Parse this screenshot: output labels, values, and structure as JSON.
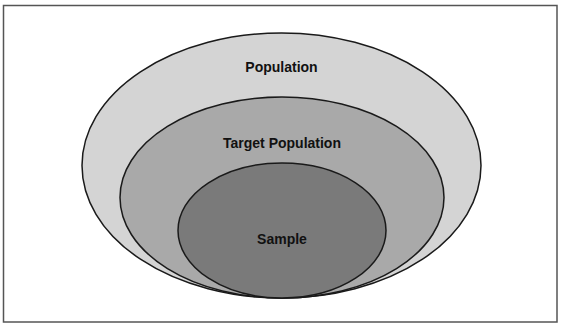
{
  "diagram": {
    "type": "nested-ellipses",
    "frame": {
      "stroke": "#555555"
    },
    "layers": [
      {
        "id": "population",
        "label": "Population",
        "fill": "#d4d4d4",
        "stroke": "#1a1a1a",
        "cx": 281.5,
        "cy": 165.5,
        "rx": 199.5,
        "ry": 132.5,
        "label_y": 72
      },
      {
        "id": "target-population",
        "label": "Target Population",
        "fill": "#a9a9a9",
        "stroke": "#1a1a1a",
        "cx": 282,
        "cy": 197.5,
        "rx": 162,
        "ry": 100.5,
        "label_y": 148
      },
      {
        "id": "sample",
        "label": "Sample",
        "fill": "#7a7a7a",
        "stroke": "#1a1a1a",
        "cx": 282,
        "cy": 230.5,
        "rx": 104,
        "ry": 67.5,
        "label_y": 244
      }
    ]
  }
}
